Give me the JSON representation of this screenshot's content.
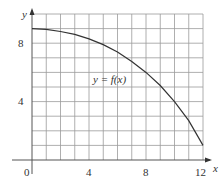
{
  "chart_data": {
    "type": "line",
    "title": "",
    "xlabel": "x",
    "ylabel": "y",
    "xlim": [
      0,
      12
    ],
    "ylim": [
      0,
      10
    ],
    "grid": true,
    "grid_step": 1,
    "x_ticks": [
      "0",
      "4",
      "8",
      "12"
    ],
    "y_ticks": [
      "4",
      "8"
    ],
    "annotation": "y = f(x)",
    "series": [
      {
        "name": "y = f(x)",
        "x": [
          0,
          1,
          2,
          3,
          4,
          5,
          6,
          7,
          8,
          9,
          10,
          11,
          12
        ],
        "values": [
          9.0,
          8.95,
          8.8,
          8.6,
          8.3,
          7.9,
          7.4,
          6.75,
          6.0,
          5.1,
          4.0,
          2.7,
          1.0
        ]
      }
    ]
  },
  "labels": {
    "origin": "0",
    "x_tick_4": "4",
    "x_tick_8": "8",
    "x_tick_12": "12",
    "y_tick_4": "4",
    "y_tick_8": "8",
    "x_axis": "x",
    "y_axis": "y",
    "curve": "y = f(x)"
  },
  "colors": {
    "grid": "#9a9a9a",
    "axis": "#555555",
    "curve": "#333333"
  }
}
